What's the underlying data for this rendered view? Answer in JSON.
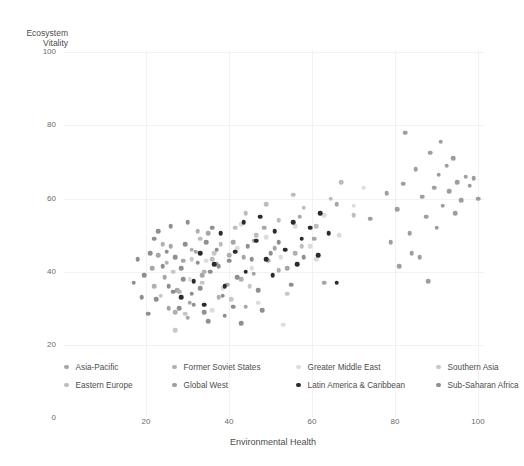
{
  "chart_data": {
    "type": "scatter",
    "title": "",
    "xlabel": "Environmental Health",
    "ylabel": "Ecosystem\nVitality",
    "xlim": [
      0,
      104
    ],
    "ylim": [
      0,
      100
    ],
    "xticks": [
      20,
      40,
      60,
      80,
      100
    ],
    "yticks": [
      0,
      20,
      40,
      60,
      80,
      100
    ],
    "grid": true,
    "legend_position": "bottom",
    "series": [
      {
        "name": "Asia-Pacific",
        "color": "#a6a6a6",
        "points": [
          [
            21.5,
            41.0
          ],
          [
            23.0,
            44.5
          ],
          [
            24.5,
            38.5
          ],
          [
            26.0,
            47.0
          ],
          [
            27.5,
            35.0
          ],
          [
            29.0,
            43.0
          ],
          [
            30.5,
            31.5
          ],
          [
            32.0,
            45.5
          ],
          [
            33.5,
            39.0
          ],
          [
            35.0,
            50.5
          ],
          [
            37.0,
            42.0
          ],
          [
            39.5,
            36.5
          ],
          [
            41.0,
            48.0
          ],
          [
            43.5,
            44.0
          ],
          [
            46.0,
            39.5
          ],
          [
            48.5,
            52.0
          ],
          [
            51.0,
            46.5
          ],
          [
            54.0,
            41.0
          ],
          [
            57.0,
            55.0
          ],
          [
            60.5,
            49.0
          ],
          [
            63.0,
            37.0
          ],
          [
            66.0,
            58.5
          ],
          [
            30.0,
            27.5
          ],
          [
            25.5,
            30.0
          ],
          [
            44.0,
            30.5
          ]
        ]
      },
      {
        "name": "Eastern Europe",
        "color": "#bdbdbd",
        "points": [
          [
            38.0,
            47.5
          ],
          [
            41.5,
            52.0
          ],
          [
            44.0,
            56.0
          ],
          [
            46.5,
            50.0
          ],
          [
            49.0,
            58.5
          ],
          [
            52.0,
            54.0
          ],
          [
            55.5,
            61.0
          ],
          [
            58.0,
            57.5
          ],
          [
            61.0,
            52.5
          ],
          [
            64.5,
            60.0
          ],
          [
            67.0,
            64.5
          ],
          [
            70.0,
            55.5
          ],
          [
            36.0,
            43.5
          ],
          [
            33.0,
            49.0
          ],
          [
            57.5,
            47.0
          ]
        ]
      },
      {
        "name": "Former Soviet States",
        "color": "#b0b0b0",
        "points": [
          [
            22.0,
            36.0
          ],
          [
            25.0,
            42.5
          ],
          [
            28.0,
            34.5
          ],
          [
            31.0,
            46.0
          ],
          [
            34.0,
            40.0
          ],
          [
            37.5,
            33.0
          ],
          [
            40.0,
            44.5
          ],
          [
            43.0,
            38.0
          ],
          [
            46.0,
            48.5
          ],
          [
            49.5,
            43.0
          ],
          [
            27.0,
            29.0
          ],
          [
            32.5,
            51.0
          ],
          [
            52.0,
            40.5
          ],
          [
            56.0,
            45.0
          ],
          [
            24.0,
            47.5
          ]
        ]
      },
      {
        "name": "Global West",
        "color": "#9e9e9e",
        "points": [
          [
            78.0,
            61.5
          ],
          [
            80.5,
            57.0
          ],
          [
            82.0,
            64.0
          ],
          [
            83.5,
            50.5
          ],
          [
            85.0,
            68.0
          ],
          [
            86.5,
            60.5
          ],
          [
            87.5,
            55.0
          ],
          [
            88.5,
            72.5
          ],
          [
            89.5,
            63.0
          ],
          [
            90.5,
            66.5
          ],
          [
            91.0,
            75.5
          ],
          [
            91.5,
            58.0
          ],
          [
            92.5,
            69.0
          ],
          [
            93.0,
            62.0
          ],
          [
            94.0,
            71.0
          ],
          [
            95.0,
            64.5
          ],
          [
            96.0,
            59.5
          ],
          [
            97.0,
            66.0
          ],
          [
            98.0,
            63.5
          ],
          [
            99.0,
            65.5
          ],
          [
            100.0,
            60.0
          ],
          [
            84.0,
            45.0
          ],
          [
            81.0,
            41.5
          ],
          [
            86.0,
            44.0
          ],
          [
            88.0,
            37.5
          ],
          [
            79.0,
            48.0
          ],
          [
            94.5,
            56.0
          ],
          [
            90.0,
            52.0
          ],
          [
            74.0,
            54.5
          ],
          [
            82.5,
            78.0
          ]
        ]
      },
      {
        "name": "Greater Middle East",
        "color": "#dcdcdc",
        "points": [
          [
            30.5,
            38.0
          ],
          [
            34.5,
            43.0
          ],
          [
            38.5,
            35.5
          ],
          [
            42.0,
            46.5
          ],
          [
            45.5,
            41.0
          ],
          [
            49.0,
            49.5
          ],
          [
            52.5,
            44.0
          ],
          [
            56.0,
            52.5
          ],
          [
            59.5,
            47.0
          ],
          [
            63.0,
            55.5
          ],
          [
            66.5,
            50.0
          ],
          [
            70.0,
            58.0
          ],
          [
            47.0,
            31.5
          ],
          [
            53.0,
            25.5
          ],
          [
            61.0,
            43.5
          ],
          [
            72.5,
            63.0
          ],
          [
            43.0,
            53.0
          ],
          [
            36.0,
            29.5
          ]
        ]
      },
      {
        "name": "Latin America & Caribbean",
        "color": "#2b2b2b",
        "points": [
          [
            28.5,
            33.0
          ],
          [
            31.5,
            37.5
          ],
          [
            34.0,
            31.0
          ],
          [
            36.5,
            42.0
          ],
          [
            39.0,
            36.0
          ],
          [
            41.5,
            45.5
          ],
          [
            44.0,
            40.0
          ],
          [
            46.5,
            48.5
          ],
          [
            49.0,
            43.5
          ],
          [
            51.0,
            51.0
          ],
          [
            53.5,
            46.0
          ],
          [
            55.5,
            53.5
          ],
          [
            57.5,
            49.0
          ],
          [
            59.5,
            52.0
          ],
          [
            61.5,
            44.5
          ],
          [
            64.0,
            50.5
          ],
          [
            66.0,
            37.0
          ],
          [
            43.5,
            53.5
          ],
          [
            47.5,
            55.0
          ],
          [
            50.5,
            39.0
          ],
          [
            33.0,
            45.0
          ],
          [
            38.0,
            50.5
          ],
          [
            56.5,
            42.0
          ],
          [
            62.0,
            56.0
          ]
        ]
      },
      {
        "name": "Southern Asia",
        "color": "#c7c7c7",
        "points": [
          [
            23.5,
            33.5
          ],
          [
            26.5,
            40.0
          ],
          [
            29.5,
            28.5
          ],
          [
            33.5,
            37.0
          ],
          [
            36.5,
            45.0
          ],
          [
            40.5,
            32.5
          ],
          [
            45.0,
            36.0
          ],
          [
            27.0,
            24.0
          ],
          [
            31.0,
            43.5
          ],
          [
            54.0,
            34.0
          ]
        ]
      },
      {
        "name": "Sub-Saharan Africa",
        "color": "#8f8f8f",
        "points": [
          [
            19.5,
            39.0
          ],
          [
            21.0,
            45.0
          ],
          [
            22.5,
            32.5
          ],
          [
            24.0,
            41.5
          ],
          [
            25.5,
            36.0
          ],
          [
            27.0,
            44.0
          ],
          [
            28.0,
            30.0
          ],
          [
            29.5,
            47.5
          ],
          [
            31.0,
            34.0
          ],
          [
            32.5,
            42.5
          ],
          [
            34.0,
            29.0
          ],
          [
            35.5,
            40.0
          ],
          [
            37.0,
            46.0
          ],
          [
            38.5,
            33.5
          ],
          [
            40.0,
            43.0
          ],
          [
            42.0,
            38.5
          ],
          [
            44.5,
            47.0
          ],
          [
            47.0,
            35.0
          ],
          [
            50.0,
            45.0
          ],
          [
            18.0,
            43.5
          ],
          [
            20.5,
            28.5
          ],
          [
            23.0,
            51.0
          ],
          [
            26.0,
            52.5
          ],
          [
            30.0,
            53.5
          ],
          [
            33.0,
            35.5
          ],
          [
            35.0,
            26.5
          ],
          [
            39.0,
            28.0
          ],
          [
            41.0,
            30.5
          ],
          [
            43.0,
            26.0
          ],
          [
            36.0,
            52.0
          ],
          [
            45.5,
            43.5
          ],
          [
            48.0,
            29.5
          ],
          [
            52.0,
            48.0
          ],
          [
            55.0,
            36.5
          ],
          [
            58.0,
            44.0
          ],
          [
            17.0,
            37.0
          ],
          [
            19.0,
            33.0
          ],
          [
            22.0,
            49.0
          ],
          [
            25.0,
            45.5
          ],
          [
            28.5,
            41.0
          ],
          [
            31.5,
            31.0
          ],
          [
            34.5,
            48.0
          ],
          [
            37.5,
            41.5
          ],
          [
            29.0,
            38.0
          ],
          [
            26.5,
            34.5
          ]
        ]
      }
    ]
  },
  "axes": {
    "y_title": "Ecosystem\nVitality",
    "x_title": "Environmental Health",
    "yticklabels": [
      "0",
      "20",
      "40",
      "60",
      "80",
      "100"
    ],
    "xticklabels": [
      "20",
      "40",
      "60",
      "80",
      "100"
    ]
  },
  "legend": {
    "entries": [
      {
        "label": "Asia-Pacific",
        "color": "#a6a6a6"
      },
      {
        "label": "Former Soviet States",
        "color": "#b0b0b0"
      },
      {
        "label": "Greater Middle East",
        "color": "#dcdcdc"
      },
      {
        "label": "Southern Asia",
        "color": "#c7c7c7"
      },
      {
        "label": "Eastern Europe",
        "color": "#bdbdbd"
      },
      {
        "label": "Global West",
        "color": "#9e9e9e"
      },
      {
        "label": "Latin America & Caribbean",
        "color": "#2b2b2b"
      },
      {
        "label": "Sub-Saharan Africa",
        "color": "#8f8f8f"
      }
    ]
  }
}
